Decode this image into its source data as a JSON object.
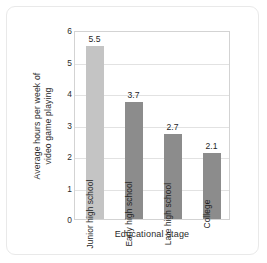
{
  "chart_data": {
    "type": "bar",
    "title": "",
    "categories": [
      "Junior high school",
      "Early high school",
      "Late high school",
      "College"
    ],
    "values": [
      5.5,
      3.7,
      2.7,
      2.1
    ],
    "value_labels": [
      "5.5",
      "3.7",
      "2.7",
      "2.1"
    ],
    "xlabel": "Educational stage",
    "ylabel": "Average hours per week of\nvideo game playing",
    "ylim": [
      0,
      6
    ],
    "yticks": [
      "6",
      "5",
      "4",
      "3",
      "2",
      "1",
      "0"
    ],
    "ytick_values": [
      6,
      5,
      4,
      3,
      2,
      1,
      0
    ],
    "grid": true,
    "legend": false,
    "bar_colors": [
      "#c4c4c4",
      "#8c8c8c",
      "#8c8c8c",
      "#8c8c8c"
    ]
  }
}
